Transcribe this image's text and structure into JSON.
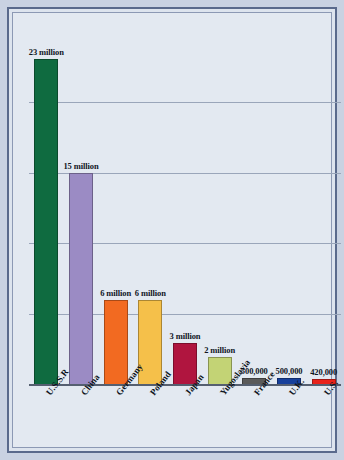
{
  "chart_data": {
    "type": "bar",
    "title": "",
    "subtitle": "",
    "xlabel": "",
    "ylabel": "",
    "categories": [
      "U.S.S.R",
      "China",
      "Germany",
      "Poland",
      "Japan",
      "Yugoslavia",
      "France",
      "U.K.",
      "U.S."
    ],
    "values": [
      23000000,
      15000000,
      6000000,
      6000000,
      3000000,
      2000000,
      500000,
      500000,
      420000
    ],
    "value_labels": [
      "23 million",
      "15 million",
      "6 million",
      "6 million",
      "3 million",
      "2 million",
      "500,000",
      "500,000",
      "420,000"
    ],
    "bar_colors": [
      "#0f6b40",
      "#9b8bc4",
      "#f26a21",
      "#f5c04a",
      "#b0153f",
      "#c3d375",
      "#5a5a5a",
      "#17409b",
      "#e8221a"
    ],
    "ylim": [
      0,
      25000000
    ],
    "gridlines": [
      20000000,
      15000000,
      10000000,
      5000000
    ],
    "grid": true,
    "legend": "none",
    "legend_position": "none",
    "annotations": []
  },
  "frame": {
    "border_color": "#5a6a8c",
    "background": "#e3e9f1"
  }
}
